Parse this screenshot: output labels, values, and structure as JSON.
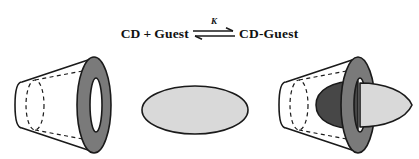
{
  "figure": {
    "caption_type": "chemical-equilibrium-scheme",
    "equation": {
      "reactant_host": "CD",
      "plus": "+",
      "reactant_guest": "Guest",
      "equilibrium_constant": "K",
      "product": "CD-Guest"
    },
    "illustrations": [
      {
        "name": "free-cyclodextrin",
        "description": "truncated-cone",
        "body_fill": "#ffffff",
        "rim_fill": "#7a7a7a",
        "cavity_fill": "#ffffff",
        "outline": "#1a1a1a"
      },
      {
        "name": "free-guest",
        "description": "ellipse",
        "fill": "#d9d9d9",
        "outline": "#1a1a1a"
      },
      {
        "name": "inclusion-complex",
        "description": "truncated-cone-with-guest",
        "body_fill": "#ffffff",
        "rim_fill": "#7a7a7a",
        "guest_inside_fill": "#474747",
        "guest_outside_fill": "#d9d9d9",
        "outline": "#1a1a1a"
      }
    ]
  },
  "colors": {
    "ink": "#1a1a1a",
    "rim_gray": "#7a7a7a",
    "guest_light": "#d9d9d9",
    "guest_dark": "#474747",
    "background": "#ffffff"
  }
}
